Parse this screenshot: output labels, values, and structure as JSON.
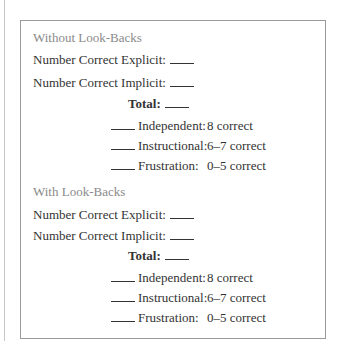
{
  "sections": [
    {
      "heading": "Without Look-Backs",
      "explicit_label": "Number Correct Explicit:",
      "implicit_label": "Number Correct Implicit:",
      "total_label": "Total:",
      "levels": [
        {
          "label": "Independent:",
          "value": "8 correct"
        },
        {
          "label": "Instructional:",
          "value": "6–7 correct"
        },
        {
          "label": "Frustration:",
          "value": "0–5 correct"
        }
      ]
    },
    {
      "heading": "With Look-Backs",
      "explicit_label": "Number Correct Explicit:",
      "implicit_label": "Number Correct Implicit:",
      "total_label": "Total:",
      "levels": [
        {
          "label": "Independent:",
          "value": "8 correct"
        },
        {
          "label": "Instructional:",
          "value": "6–7 correct"
        },
        {
          "label": "Frustration:",
          "value": "0–5 correct"
        }
      ]
    }
  ]
}
